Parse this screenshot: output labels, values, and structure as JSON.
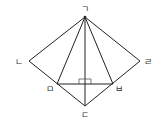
{
  "diagram": {
    "points": [
      {
        "id": "A",
        "label": "ㄱ",
        "x": 85,
        "y": 17
      },
      {
        "id": "B",
        "label": "ㄴ",
        "x": 29,
        "y": 61
      },
      {
        "id": "C",
        "label": "ㄷ",
        "x": 85,
        "y": 106
      },
      {
        "id": "D",
        "label": "ㄹ",
        "x": 140,
        "y": 61
      },
      {
        "id": "E",
        "label": "ㅁ",
        "x": 57,
        "y": 84
      },
      {
        "id": "F",
        "label": "ㅂ",
        "x": 113,
        "y": 84
      }
    ],
    "segments": [
      [
        "A",
        "B"
      ],
      [
        "B",
        "C"
      ],
      [
        "C",
        "D"
      ],
      [
        "D",
        "A"
      ],
      [
        "A",
        "E"
      ],
      [
        "A",
        "F"
      ],
      [
        "A",
        "C"
      ],
      [
        "E",
        "F"
      ]
    ],
    "right_angle_at": {
      "x": 85,
      "y": 84
    },
    "colors": {
      "line": "#222222",
      "label": "#333333"
    }
  }
}
